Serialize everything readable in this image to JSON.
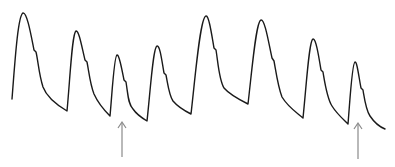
{
  "figure": {
    "type": "waveform",
    "trace_color": "#1a1a1a",
    "arrow_color": "#8a8a8a",
    "beats": [
      {
        "index": 1,
        "upstroke_start": [
          12,
          99
        ],
        "peak": [
          23,
          13
        ],
        "notch": [
          35,
          53
        ],
        "trough": [
          67,
          111
        ]
      },
      {
        "index": 2,
        "upstroke_start": [
          67,
          111
        ],
        "peak": [
          76,
          31
        ],
        "notch": [
          86,
          63
        ],
        "trough": [
          110,
          116
        ]
      },
      {
        "index": 3,
        "upstroke_start": [
          110,
          116
        ],
        "peak": [
          117,
          55
        ],
        "notch": [
          125,
          82
        ],
        "trough": [
          147,
          121
        ],
        "marked": true
      },
      {
        "index": 4,
        "upstroke_start": [
          147,
          121
        ],
        "peak": [
          157,
          46
        ],
        "notch": [
          165,
          75
        ],
        "trough": [
          191,
          114
        ]
      },
      {
        "index": 5,
        "upstroke_start": [
          191,
          114
        ],
        "peak": [
          206,
          16
        ],
        "notch": [
          215,
          50
        ],
        "trough": [
          248,
          104
        ]
      },
      {
        "index": 6,
        "upstroke_start": [
          248,
          104
        ],
        "peak": [
          261,
          20
        ],
        "notch": [
          273,
          61
        ],
        "trough": [
          303,
          118
        ]
      },
      {
        "index": 7,
        "upstroke_start": [
          303,
          118
        ],
        "peak": [
          313,
          39
        ],
        "notch": [
          322,
          72
        ],
        "trough": [
          348,
          124
        ]
      },
      {
        "index": 8,
        "upstroke_start": [
          348,
          124
        ],
        "peak": [
          355,
          62
        ],
        "notch": [
          362,
          90
        ],
        "trough": [
          385,
          129
        ],
        "marked": true
      }
    ],
    "arrows": [
      {
        "x": 122,
        "y_tip": 122,
        "y_tail": 157,
        "points_to_beat": 3
      },
      {
        "x": 358,
        "y_tip": 123,
        "y_tail": 159,
        "points_to_beat": 8
      }
    ]
  }
}
